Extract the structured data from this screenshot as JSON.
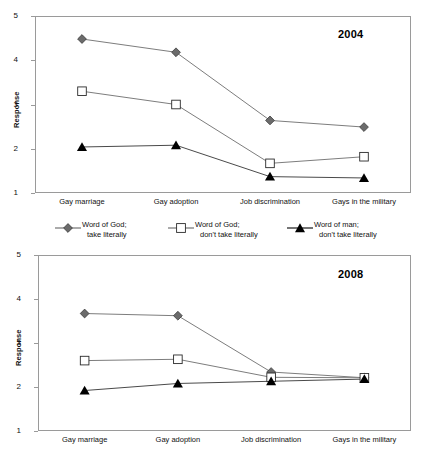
{
  "figure": {
    "ylabel": "Response",
    "yticks": [
      1,
      2,
      3,
      4,
      5
    ],
    "ylim": [
      1,
      5
    ],
    "categories": [
      "Gay marriage",
      "Gay adoption",
      "Job discrimination",
      "Gays in the military"
    ],
    "colors": {
      "word_of_god_literal": "#6b6b6b",
      "word_of_god_not_literal": "#ffffff",
      "word_of_man_not_literal": "#000000",
      "line": "#7d7d7d",
      "frame": "#9a9a9a",
      "text": "#111111"
    }
  },
  "legend": {
    "entries": [
      {
        "marker": "filled-diamond-icon",
        "line1": "Word of God;",
        "line2": "take literally"
      },
      {
        "marker": "open-square-icon",
        "line1": "Word of God;",
        "line2": "don't take literally"
      },
      {
        "marker": "filled-triangle-icon",
        "line1": "Word of man;",
        "line2": "don't take literally"
      }
    ]
  },
  "chart_data": [
    {
      "type": "line",
      "title": "2004",
      "xlabel": "",
      "ylabel": "Response",
      "ylim": [
        1,
        5
      ],
      "yticks": [
        1,
        2,
        3,
        4,
        5
      ],
      "grid": false,
      "legend_position": "below",
      "categories": [
        "Gay marriage",
        "Gay adoption",
        "Job discrimination",
        "Gays in the military"
      ],
      "series": [
        {
          "name": "Word of God; take literally",
          "marker": "filled-diamond",
          "values": [
            4.48,
            4.18,
            2.64,
            2.49
          ]
        },
        {
          "name": "Word of God; don't take literally",
          "marker": "open-square",
          "values": [
            3.3,
            3.0,
            1.67,
            1.82
          ]
        },
        {
          "name": "Word of man; don't take literally",
          "marker": "filled-triangle",
          "values": [
            2.04,
            2.08,
            1.37,
            1.34
          ]
        }
      ]
    },
    {
      "type": "line",
      "title": "2008",
      "xlabel": "",
      "ylabel": "Response",
      "ylim": [
        1,
        5
      ],
      "yticks": [
        1,
        2,
        3,
        4,
        5
      ],
      "grid": false,
      "legend_position": "below",
      "categories": [
        "Gay marriage",
        "Gay adoption",
        "Job discrimination",
        "Gays in the military"
      ],
      "series": [
        {
          "name": "Word of God; take literally",
          "marker": "filled-diamond",
          "values": [
            3.67,
            3.62,
            2.34,
            2.21
          ]
        },
        {
          "name": "Word of God; don't take literally",
          "marker": "open-square",
          "values": [
            2.6,
            2.63,
            2.22,
            2.21
          ]
        },
        {
          "name": "Word of man; don't take literally",
          "marker": "filled-triangle",
          "values": [
            1.92,
            2.08,
            2.13,
            2.18
          ]
        }
      ]
    }
  ]
}
